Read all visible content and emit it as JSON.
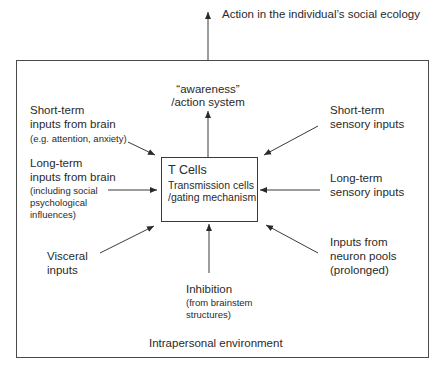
{
  "diagram": {
    "top_label": "Action in the individual’s social ecology",
    "awareness": [
      "“awareness”",
      "/action system"
    ],
    "center_box": {
      "title": "T Cells",
      "line1": "Transmission cells",
      "line2": "/gating mechanism"
    },
    "inputs": {
      "short_brain": {
        "l1": "Short-term",
        "l2": "inputs from brain",
        "sub": "(e.g. attention, anxiety)"
      },
      "long_brain": {
        "l1": "Long-term",
        "l2": "inputs from brain",
        "sub1": "(including social",
        "sub2": "psychological",
        "sub3": "influences)"
      },
      "visceral": {
        "l1": "Visceral",
        "l2": "inputs"
      },
      "inhibition": {
        "l1": "Inhibition",
        "sub1": "(from brainstem",
        "sub2": "structures)"
      },
      "short_sensory": {
        "l1": "Short-term",
        "l2": "sensory inputs"
      },
      "long_sensory": {
        "l1": "Long-term",
        "l2": "sensory inputs"
      },
      "neuron_pools": {
        "l1": "Inputs from",
        "l2": "neuron pools",
        "l3": "(prolonged)"
      }
    },
    "environment_label": "Intrapersonal environment",
    "colors": {
      "line": "#3a3a3a",
      "text": "#2a2a2a",
      "background": "#ffffff"
    }
  }
}
